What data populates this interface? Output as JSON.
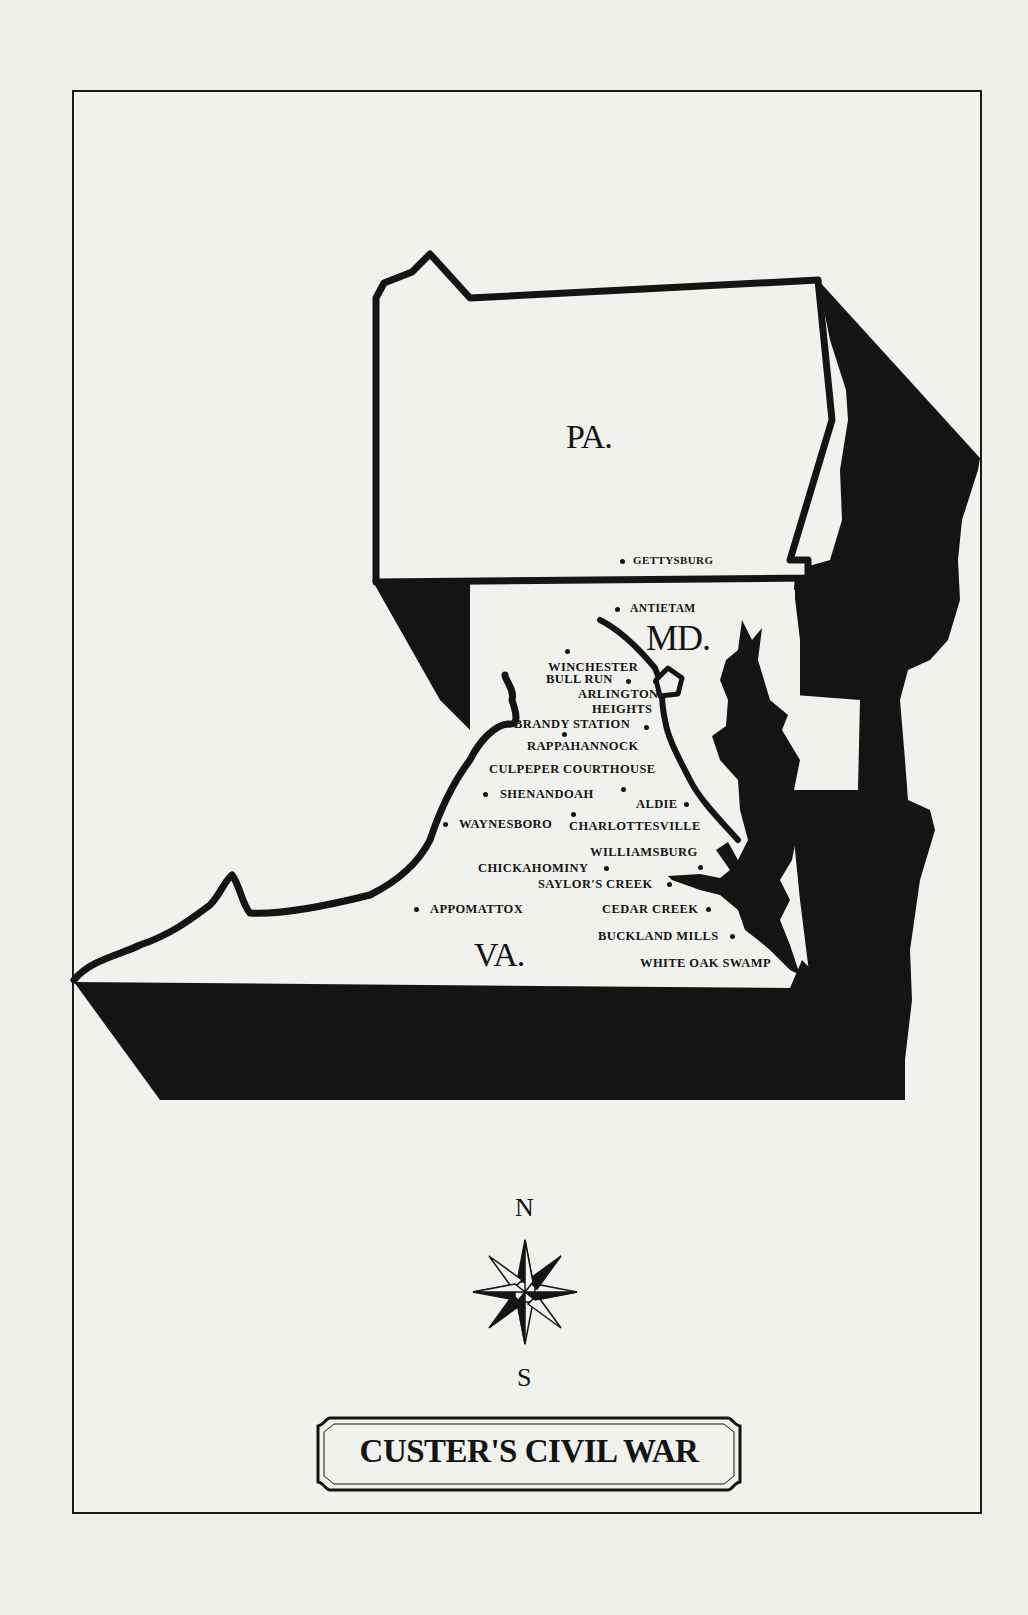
{
  "title": "CUSTER'S CIVIL WAR",
  "colors": {
    "paper": "#efefec",
    "ink": "#141414"
  },
  "compass": {
    "north": "N",
    "south": "S"
  },
  "states": [
    {
      "id": "pa",
      "label": "PA."
    },
    {
      "id": "md",
      "label": "MD."
    },
    {
      "id": "va",
      "label": "VA."
    }
  ],
  "towns": [
    {
      "name": "GETTYSBURG"
    },
    {
      "name": "ANTIETAM"
    },
    {
      "name": "WINCHESTER"
    },
    {
      "name": "BULL RUN"
    },
    {
      "name": "ARLINGTON"
    },
    {
      "name": "HEIGHTS"
    },
    {
      "name": "BRANDY STATION"
    },
    {
      "name": "RAPPAHANNOCK"
    },
    {
      "name": "CULPEPER COURTHOUSE"
    },
    {
      "name": "SHENANDOAH"
    },
    {
      "name": "ALDIE"
    },
    {
      "name": "WAYNESBORO"
    },
    {
      "name": "CHARLOTTESVILLE"
    },
    {
      "name": "WILLIAMSBURG"
    },
    {
      "name": "CHICKAHOMINY"
    },
    {
      "name": "SAYLOR'S CREEK"
    },
    {
      "name": "APPOMATTOX"
    },
    {
      "name": "CEDAR CREEK"
    },
    {
      "name": "BUCKLAND MILLS"
    },
    {
      "name": "WHITE OAK SWAMP"
    }
  ]
}
